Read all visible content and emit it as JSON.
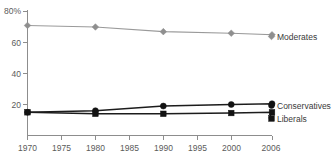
{
  "chart_data": {
    "type": "line",
    "title": "",
    "subtitle": "",
    "xlabel": "",
    "ylabel": "",
    "x": [
      1970,
      1980,
      1990,
      2000,
      2006
    ],
    "xtick_labels": [
      "1970",
      "1975",
      "1980",
      "1985",
      "1990",
      "1995",
      "2000",
      "2006"
    ],
    "xtick_values": [
      1970,
      1975,
      1980,
      1985,
      1990,
      1995,
      2000,
      2006
    ],
    "ytick_labels": [
      "80%",
      "60",
      "40",
      "20"
    ],
    "ytick_values": [
      80,
      60,
      40,
      20
    ],
    "xlim": [
      1970,
      2006
    ],
    "ylim": [
      0,
      80
    ],
    "grid": false,
    "legend_position": "right-inline-end-of-line",
    "series": [
      {
        "name": "Moderates",
        "marker": "diamond",
        "color": "#8f8f8f",
        "values": [
          71,
          70,
          67,
          66,
          65
        ]
      },
      {
        "name": "Conservatives",
        "marker": "circle",
        "color": "#121212",
        "values": [
          15,
          16,
          19,
          20,
          20.5
        ]
      },
      {
        "name": "Liberals",
        "marker": "square",
        "color": "#121212",
        "values": [
          15,
          14,
          14,
          14.5,
          15
        ]
      }
    ]
  },
  "labels": {
    "y_top": "80%",
    "y_60": "60",
    "y_40": "40",
    "y_20": "20",
    "x_1970": "1970",
    "x_1975": "1975",
    "x_1980": "1980",
    "x_1985": "1985",
    "x_1990": "1990",
    "x_1995": "1995",
    "x_2000": "2000",
    "x_2006": "2006",
    "series_moderates": "Moderates",
    "series_conservatives": "Conservatives",
    "series_liberals": "Liberals"
  },
  "colors": {
    "moderates": "#8f8f8f",
    "conservatives": "#121212",
    "liberals": "#121212",
    "axis": "#8d8d8d",
    "tick_text": "#5b5b5b",
    "label_text": "#3a3a3a",
    "background": "#ffffff"
  }
}
